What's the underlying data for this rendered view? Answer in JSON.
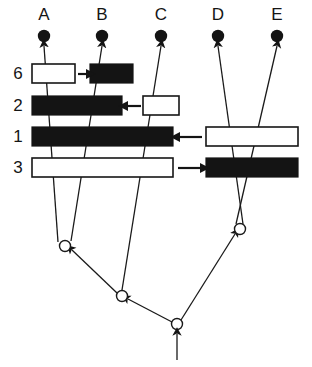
{
  "figure": {
    "background_color": "#ffffff",
    "line_color": "#1a1a1a",
    "black_fill": "#141414",
    "white_fill": "#ffffff",
    "width": 312,
    "height": 367
  },
  "taxa": [
    {
      "label": "A",
      "x": 44,
      "label_y": 20,
      "dot_y": 36
    },
    {
      "label": "B",
      "x": 102,
      "label_y": 20,
      "dot_y": 36
    },
    {
      "label": "C",
      "x": 161,
      "label_y": 20,
      "dot_y": 36
    },
    {
      "label": "D",
      "x": 218,
      "label_y": 20,
      "dot_y": 36
    },
    {
      "label": "E",
      "x": 277,
      "label_y": 20,
      "dot_y": 36
    }
  ],
  "character_rows": [
    {
      "label": "6",
      "label_x": 18,
      "label_y": 79,
      "y": 64,
      "height": 19,
      "bars": [
        {
          "state": "white",
          "x": 32,
          "width": 43
        },
        {
          "state": "black",
          "x": 90,
          "width": 43
        }
      ],
      "annotation_arrow": {
        "direction": "right",
        "x1": 78,
        "x2": 88,
        "y": 74
      }
    },
    {
      "label": "2",
      "label_x": 18,
      "label_y": 111,
      "y": 96,
      "height": 19,
      "bars": [
        {
          "state": "black",
          "x": 32,
          "width": 90
        },
        {
          "state": "white",
          "x": 143,
          "width": 36
        }
      ],
      "annotation_arrow": {
        "direction": "left",
        "x1": 141,
        "x2": 126,
        "y": 106
      }
    },
    {
      "label": "1",
      "label_x": 18,
      "label_y": 142,
      "y": 127,
      "height": 19,
      "bars": [
        {
          "state": "black",
          "x": 32,
          "width": 141
        },
        {
          "state": "white",
          "x": 206,
          "width": 92
        }
      ],
      "annotation_arrow": {
        "direction": "left",
        "x1": 202,
        "x2": 178,
        "y": 137
      }
    },
    {
      "label": "3",
      "label_x": 18,
      "label_y": 173,
      "y": 158,
      "height": 19,
      "bars": [
        {
          "state": "white",
          "x": 32,
          "width": 141
        },
        {
          "state": "black",
          "x": 206,
          "width": 92
        }
      ],
      "annotation_arrow": {
        "direction": "right",
        "x1": 178,
        "x2": 202,
        "y": 168
      }
    }
  ],
  "internal_nodes": [
    {
      "name": "node-ab",
      "x": 65,
      "y": 246,
      "r": 5.5
    },
    {
      "name": "node-abc",
      "x": 122,
      "y": 296,
      "r": 5.5
    },
    {
      "name": "node-root",
      "x": 177,
      "y": 324,
      "r": 5.5
    },
    {
      "name": "node-de",
      "x": 240,
      "y": 229,
      "r": 5.5
    }
  ],
  "root_arrow": {
    "x": 177,
    "y_from": 360,
    "y_to": 334
  },
  "branches": [
    {
      "name": "branch-A",
      "from_x": 58,
      "from_y": 242,
      "to_x": 44,
      "to_y": 46
    },
    {
      "name": "branch-B",
      "from_x": 71,
      "from_y": 241,
      "to_x": 102,
      "to_y": 46
    },
    {
      "name": "branch-C",
      "from_x": 122,
      "from_y": 290,
      "to_x": 161,
      "to_y": 46
    },
    {
      "name": "branch-D",
      "from_x": 243,
      "from_y": 224,
      "to_x": 218,
      "to_y": 46
    },
    {
      "name": "branch-E",
      "from_x": 236,
      "from_y": 224,
      "to_x": 277,
      "to_y": 46
    },
    {
      "name": "branch-node-ab",
      "from_x": 117,
      "from_y": 293,
      "to_x": 72,
      "to_y": 250
    },
    {
      "name": "branch-node-abc",
      "from_x": 172,
      "from_y": 322,
      "to_x": 128,
      "to_y": 299
    },
    {
      "name": "branch-node-de",
      "from_x": 181,
      "from_y": 320,
      "to_x": 235,
      "to_y": 234
    }
  ]
}
